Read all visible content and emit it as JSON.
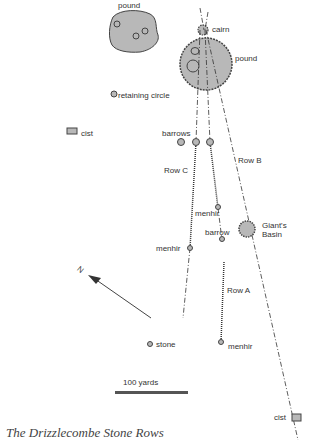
{
  "title": "The Drizzlecombe Stone Rows",
  "labels": {
    "pound_nw": "pound",
    "cairn": "cairn",
    "pound_main": "pound",
    "retaining_circle": "retaining circle",
    "cist_w": "cist",
    "barrows": "barrows",
    "row_c": "Row C",
    "row_b": "Row B",
    "menhir_b": "menhir",
    "barrow": "barrow",
    "giants_basin": "Giant's\nBasin",
    "giants_basin_l1": "Giant's",
    "giants_basin_l2": "Basin",
    "menhir_c": "menhir",
    "row_a": "Row A",
    "north": "N",
    "stone": "stone",
    "menhir_a": "menhir",
    "scale": "100 yards",
    "cist_se": "cist"
  },
  "colors": {
    "fill": "#b8b8b8",
    "stroke": "#444444",
    "line": "#333333"
  }
}
